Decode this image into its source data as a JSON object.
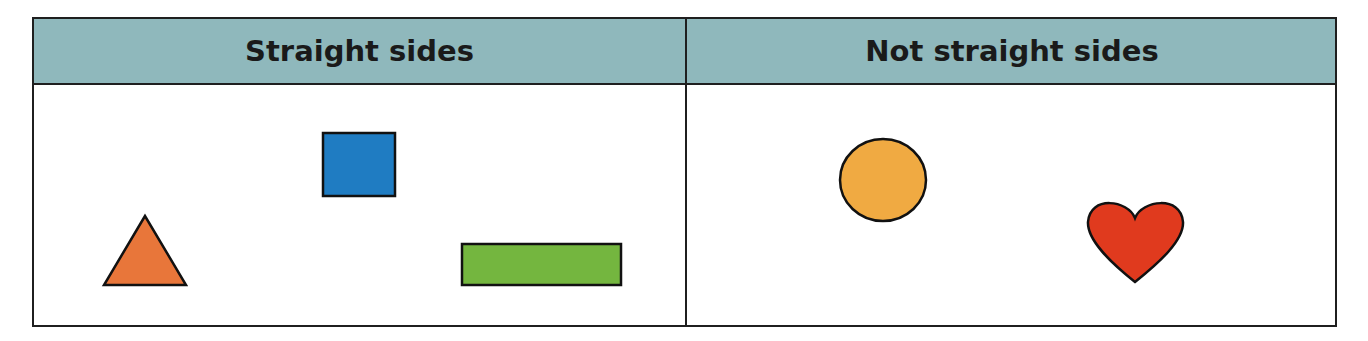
{
  "table": {
    "columns": [
      {
        "header": "Straight sides",
        "shapes": [
          {
            "type": "square",
            "color": "#1f7cc2"
          },
          {
            "type": "triangle",
            "color": "#e8763a"
          },
          {
            "type": "rectangle",
            "color": "#74b63f"
          }
        ]
      },
      {
        "header": "Not straight sides",
        "shapes": [
          {
            "type": "circle",
            "color": "#f0aa42"
          },
          {
            "type": "heart",
            "color": "#e03a1e"
          }
        ]
      }
    ],
    "header_color": "#8fb8bc",
    "border_color": "#1f1f1f"
  }
}
